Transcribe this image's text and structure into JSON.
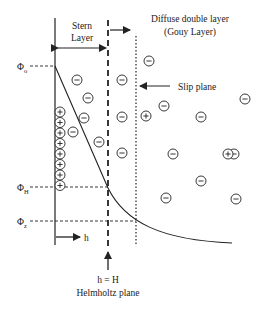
{
  "labels": {
    "stern_line1": "Stern",
    "stern_line2": "Layer",
    "diffuse_line1": "Diffuse double layer",
    "diffuse_line2": "(Gouy Layer)",
    "slip_plane": "Slip plane",
    "phi": "Φ",
    "phi0_sub": "o",
    "phiH_sub": "H",
    "phiZ_sub": "z",
    "h_axis": "h",
    "h_eq_H": "h = H",
    "helmholtz": "Helmholtz plane"
  },
  "ions": {
    "plus_symbol": "+",
    "minus_symbol": "−",
    "stern_positive_count": 8,
    "negative": [
      [
        77,
        80
      ],
      [
        88,
        98
      ],
      [
        84,
        118
      ],
      [
        73,
        132
      ],
      [
        99,
        142
      ],
      [
        122,
        80
      ],
      [
        122,
        117
      ],
      [
        122,
        153
      ],
      [
        149,
        61
      ],
      [
        164,
        106
      ],
      [
        201,
        117
      ],
      [
        245,
        99
      ],
      [
        173,
        154
      ],
      [
        234,
        154
      ],
      [
        201,
        181
      ],
      [
        166,
        198
      ],
      [
        236,
        199
      ]
    ],
    "positive": [
      [
        146,
        116
      ],
      [
        228,
        154
      ]
    ]
  },
  "colors": {
    "line": "#222222",
    "background": "#ffffff"
  }
}
